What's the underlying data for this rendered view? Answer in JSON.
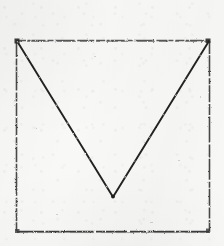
{
  "document": {
    "kind": "scanned-line-drawing",
    "medium": "fax / photocopy scan",
    "page_width": 224,
    "page_height": 246,
    "paper_color": "#f8f8f6",
    "ink_color": "#2b2b2b",
    "ink_color_faint": "#555555"
  },
  "figure": {
    "name": "square-with-v",
    "stroke_width": 1.6,
    "square": {
      "name": "square-outline",
      "left": 16,
      "top": 40,
      "right": 210,
      "bottom": 232,
      "width": 194,
      "height": 192,
      "corners": [
        {
          "name": "top-left",
          "x": 16,
          "y": 40
        },
        {
          "name": "top-right",
          "x": 210,
          "y": 40
        },
        {
          "name": "bottom-right",
          "x": 210,
          "y": 232
        },
        {
          "name": "bottom-left",
          "x": 16,
          "y": 232
        }
      ]
    },
    "vee": {
      "name": "v-shape",
      "points": [
        {
          "name": "left-arm-start",
          "x": 17,
          "y": 41
        },
        {
          "name": "vertex",
          "x": 113,
          "y": 197
        },
        {
          "name": "right-arm-end",
          "x": 209,
          "y": 41
        }
      ],
      "vertex_x": 113,
      "vertex_y": 197
    }
  }
}
